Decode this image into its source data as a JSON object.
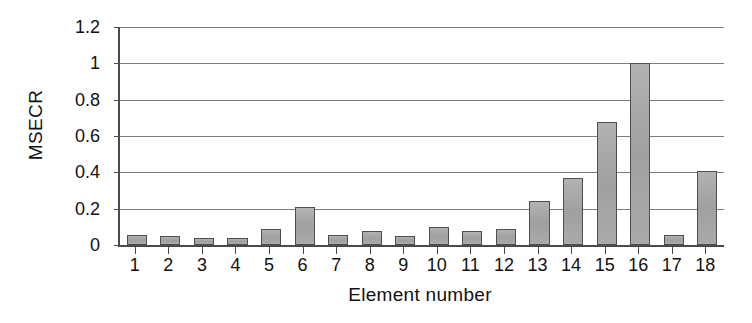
{
  "chart_data": {
    "type": "bar",
    "title": "",
    "xlabel": "Element number",
    "ylabel": "MSECR",
    "categories": [
      "1",
      "2",
      "3",
      "4",
      "5",
      "6",
      "7",
      "8",
      "9",
      "10",
      "11",
      "12",
      "13",
      "14",
      "15",
      "16",
      "17",
      "18"
    ],
    "values": [
      0.055,
      0.047,
      0.037,
      0.038,
      0.088,
      0.21,
      0.055,
      0.078,
      0.05,
      0.1,
      0.075,
      0.09,
      0.245,
      0.37,
      0.675,
      1.0,
      0.055,
      0.405
    ],
    "ylim": [
      0,
      1.2
    ],
    "yticks": [
      0,
      0.2,
      0.4,
      0.6,
      0.8,
      1,
      1.2
    ],
    "ytick_labels": [
      "0",
      "0.2",
      "0.4",
      "0.6",
      "0.8",
      "1",
      "1.2"
    ],
    "grid": true,
    "grid_axis": "y",
    "legend": false,
    "legend_position": "none",
    "bar_fill_color": "#a8a8a8",
    "bar_edge_color": "#4f4f4f",
    "axis_color": "#4a4a4a",
    "gridline_color": "#7d7d7d",
    "background_color": "#ffffff"
  }
}
